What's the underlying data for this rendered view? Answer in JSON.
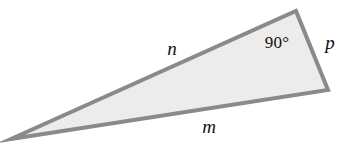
{
  "figure": {
    "kind": "right-triangle-diagram",
    "canvas": {
      "width": 354,
      "height": 150
    },
    "colors": {
      "background": "#ffffff",
      "fill": "#ececec",
      "stroke": "#8a8a8a",
      "text": "#111111"
    },
    "stroke_width": 4,
    "vertices": {
      "left_tip": {
        "name": "left-acute-vertex",
        "x": 11,
        "y": 139
      },
      "top_right": {
        "name": "right-angle-vertex",
        "x": 296,
        "y": 11
      },
      "bottom_right": {
        "name": "right-acute-vertex",
        "x": 328,
        "y": 90
      }
    },
    "polygon_points": "11,139 296,11 328,90",
    "labels": {
      "side_n": {
        "text": "n",
        "x": 172,
        "y": 48,
        "style": "italic",
        "side": "left-long-side"
      },
      "side_m": {
        "text": "m",
        "x": 209,
        "y": 126,
        "style": "italic",
        "side": "bottom-long-side"
      },
      "side_p": {
        "text": "p",
        "x": 330,
        "y": 42,
        "style": "italic",
        "side": "right-short-side"
      },
      "angle_marker": {
        "text": "90°",
        "x": 277,
        "y": 42,
        "style": "upright",
        "at_vertex": "top_right"
      }
    }
  }
}
